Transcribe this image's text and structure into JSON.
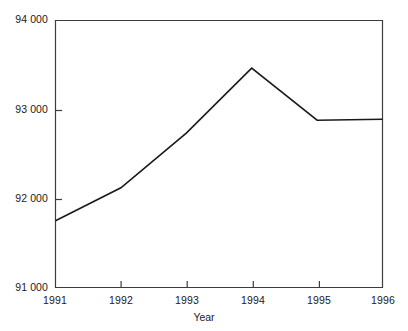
{
  "chart_data": {
    "type": "line",
    "title": "",
    "subtitle": "",
    "xlabel": "Year",
    "ylabel": "",
    "x": [
      1991,
      1992,
      1993,
      1994,
      1995,
      1996
    ],
    "categories": [
      "1991",
      "1992",
      "1993",
      "1994",
      "1995",
      "1996"
    ],
    "values": [
      91750,
      92120,
      92735,
      93465,
      92880,
      92890
    ],
    "series": [
      {
        "name": "",
        "values": [
          91750,
          92120,
          92735,
          93465,
          92880,
          92890
        ]
      }
    ],
    "xlim": [
      1991,
      1996
    ],
    "ylim": [
      91000,
      94000
    ],
    "ytick_labels": [
      "94 000",
      "93 000",
      "92 000",
      "91 000"
    ],
    "ytick_values": [
      94000,
      93000,
      92000,
      91000
    ],
    "xtick_labels": [
      "1991",
      "1992",
      "1993",
      "1994",
      "1995",
      "1996"
    ],
    "grid": false,
    "legend": false,
    "legend_position": "none",
    "line_color": "#1a1a1a",
    "background_color": "#ffffff",
    "axis_color": "#3c3c3c",
    "annotations": []
  },
  "axis": {
    "x_title": "Year",
    "y_title": ""
  }
}
